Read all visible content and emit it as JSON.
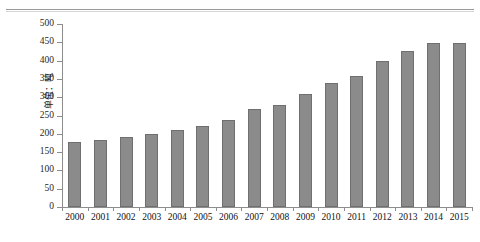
{
  "chart_data": {
    "type": "bar",
    "title": "",
    "xlabel": "",
    "ylabel": "单位：吨",
    "categories": [
      "2000",
      "2001",
      "2002",
      "2003",
      "2004",
      "2005",
      "2006",
      "2007",
      "2008",
      "2009",
      "2010",
      "2011",
      "2012",
      "2013",
      "2014",
      "2015"
    ],
    "values": [
      177,
      182,
      190,
      200,
      210,
      222,
      238,
      268,
      279,
      310,
      338,
      357,
      400,
      425,
      449,
      448
    ],
    "ylim": [
      0,
      500
    ],
    "ytick_labels": [
      "0",
      "50",
      "100",
      "150",
      "200",
      "250",
      "300",
      "350",
      "400",
      "450",
      "500"
    ],
    "ytick_values": [
      0,
      50,
      100,
      150,
      200,
      250,
      300,
      350,
      400,
      450,
      500
    ],
    "grid": false,
    "legend": null,
    "bar_color": "#8b8b8b",
    "bar_edge_color": "#6f6f6f",
    "axis_color": "#8d8d8d"
  }
}
